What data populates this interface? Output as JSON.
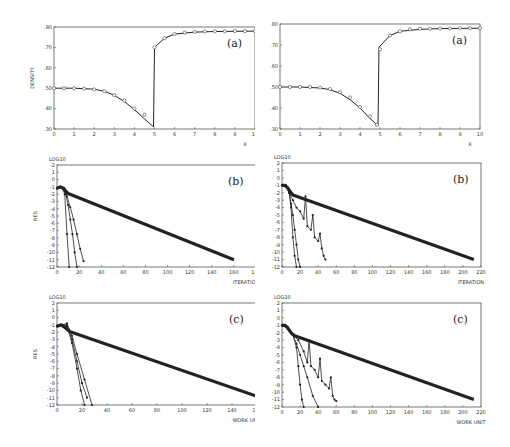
{
  "chart_data": [
    {
      "id": "top-left",
      "type": "line",
      "panel_label": "(a)",
      "ylabel": "DENSITY",
      "xlabel": "X",
      "xlim": [
        0,
        10
      ],
      "ylim": [
        0.3,
        0.8
      ],
      "x_ticks": [
        "0",
        "1",
        "2",
        "3",
        "4",
        "5",
        "6",
        "7",
        "8",
        "9",
        "10"
      ],
      "y_ticks": [
        ".30",
        ".40",
        ".50",
        ".60",
        ".70",
        ".80"
      ],
      "series": [
        {
          "name": "exact",
          "style": "solid",
          "x": [
            0,
            1,
            2,
            2.5,
            3,
            3.5,
            4,
            4.5,
            4.9,
            4.95,
            5.0,
            5.5,
            6,
            7,
            8,
            9,
            10
          ],
          "y": [
            0.5,
            0.5,
            0.495,
            0.485,
            0.465,
            0.435,
            0.395,
            0.35,
            0.315,
            0.31,
            0.7,
            0.745,
            0.765,
            0.775,
            0.778,
            0.779,
            0.78
          ]
        },
        {
          "name": "computed",
          "style": "markers-circle",
          "x": [
            0,
            0.5,
            1,
            1.5,
            2,
            2.5,
            3,
            3.5,
            4,
            4.5,
            5,
            5.5,
            6,
            6.5,
            7,
            7.5,
            8,
            8.5,
            9,
            9.5,
            10
          ],
          "y": [
            0.5,
            0.5,
            0.5,
            0.498,
            0.494,
            0.485,
            0.466,
            0.44,
            0.4,
            0.37,
            0.7,
            0.745,
            0.765,
            0.772,
            0.776,
            0.778,
            0.779,
            0.779,
            0.78,
            0.78,
            0.78
          ]
        }
      ]
    },
    {
      "id": "top-right",
      "type": "line",
      "panel_label": "(a)",
      "ylabel": "",
      "xlabel": "X",
      "xlim": [
        0,
        10
      ],
      "ylim": [
        0.3,
        0.8
      ],
      "x_ticks": [
        "0",
        "1",
        "2",
        "3",
        "4",
        "5",
        "6",
        "7",
        "8",
        "9",
        "10"
      ],
      "y_ticks": [
        ".30",
        ".40",
        ".50",
        ".60",
        ".70",
        ".80"
      ],
      "series": [
        {
          "name": "exact",
          "style": "solid",
          "x": [
            0,
            1,
            2,
            2.5,
            3,
            3.5,
            4,
            4.5,
            4.85,
            4.9,
            4.95,
            5.5,
            6,
            7,
            8,
            9,
            10
          ],
          "y": [
            0.5,
            0.5,
            0.495,
            0.487,
            0.47,
            0.44,
            0.4,
            0.35,
            0.32,
            0.315,
            0.69,
            0.745,
            0.765,
            0.775,
            0.778,
            0.779,
            0.78
          ]
        },
        {
          "name": "computed",
          "style": "markers-circle",
          "x": [
            0,
            0.5,
            1,
            1.5,
            2,
            2.5,
            3,
            3.5,
            4,
            4.5,
            4.85,
            5,
            5.5,
            6,
            6.5,
            7,
            7.5,
            8,
            8.5,
            9,
            9.5,
            10
          ],
          "y": [
            0.5,
            0.5,
            0.5,
            0.5,
            0.497,
            0.49,
            0.475,
            0.45,
            0.405,
            0.36,
            0.32,
            0.68,
            0.745,
            0.765,
            0.775,
            0.777,
            0.778,
            0.779,
            0.779,
            0.78,
            0.78,
            0.78
          ]
        }
      ]
    },
    {
      "id": "middle-left",
      "type": "line",
      "panel_label": "(b)",
      "ylabel": "RES",
      "ytitle_top": "LOG10",
      "xlabel": "ITERATION",
      "xlim": [
        0,
        180
      ],
      "ylim": [
        -12,
        2
      ],
      "x_ticks": [
        "0",
        "20",
        "40",
        "60",
        "80",
        "100",
        "120",
        "140",
        "160",
        "180"
      ],
      "y_ticks": [
        "2",
        "1",
        "0",
        "-1",
        "-2",
        "-3",
        "-4",
        "-5",
        "-6",
        "-7",
        "-8",
        "-9",
        "-10",
        "-11",
        "-12"
      ],
      "series": [
        {
          "name": "slow",
          "style": "thick",
          "x": [
            0,
            3,
            6,
            8,
            10,
            160
          ],
          "y": [
            -1.2,
            -1.0,
            -1.2,
            -1.6,
            -1.9,
            -11.0
          ]
        },
        {
          "name": "fast-1",
          "style": "markers",
          "x": [
            0,
            3,
            5,
            7,
            9,
            11
          ],
          "y": [
            -1.2,
            -1.0,
            -1.2,
            -2.0,
            -7.5,
            -12.0
          ]
        },
        {
          "name": "fast-2",
          "style": "markers",
          "x": [
            0,
            3,
            6,
            8,
            10,
            12,
            14,
            16,
            18
          ],
          "y": [
            -1.2,
            -1.0,
            -1.3,
            -2.0,
            -3.5,
            -5.5,
            -7.5,
            -10.0,
            -12.0
          ]
        },
        {
          "name": "fast-3",
          "style": "markers",
          "x": [
            0,
            3,
            6,
            9,
            12,
            15,
            18,
            21,
            24
          ],
          "y": [
            -1.2,
            -1.0,
            -1.4,
            -2.3,
            -3.8,
            -5.5,
            -7.5,
            -9.5,
            -11.2
          ]
        }
      ]
    },
    {
      "id": "middle-right",
      "type": "line",
      "panel_label": "(b)",
      "ylabel": "",
      "ytitle_top": "LOG10",
      "xlabel": "ITERATION",
      "xlim": [
        0,
        220
      ],
      "ylim": [
        -12,
        2
      ],
      "x_ticks": [
        "0",
        "20",
        "40",
        "60",
        "80",
        "100",
        "120",
        "140",
        "160",
        "180",
        "200",
        "220"
      ],
      "y_ticks": [
        "2",
        "1",
        "0",
        "-1",
        "-2",
        "-3",
        "-4",
        "-5",
        "-6",
        "-7",
        "-8",
        "-9",
        "-10",
        "-11",
        "-12"
      ],
      "series": [
        {
          "name": "slow",
          "style": "thick",
          "x": [
            0,
            3,
            6,
            10,
            12,
            212
          ],
          "y": [
            -1.0,
            -1.0,
            -1.3,
            -2.0,
            -2.3,
            -11.0
          ]
        },
        {
          "name": "fast-1",
          "style": "markers",
          "x": [
            0,
            4,
            8,
            10,
            12,
            14,
            16
          ],
          "y": [
            -1.0,
            -1.0,
            -2.0,
            -4.0,
            -8.0,
            -10.5,
            -12.0
          ]
        },
        {
          "name": "fast-2",
          "style": "markers",
          "x": [
            0,
            4,
            8,
            10,
            12,
            14,
            16,
            18,
            20
          ],
          "y": [
            -1.0,
            -1.0,
            -2.0,
            -3.5,
            -5.0,
            -7.0,
            -9.0,
            -11.0,
            -12.0
          ]
        },
        {
          "name": "oscillating",
          "style": "markers",
          "x": [
            0,
            4,
            8,
            12,
            16,
            20,
            24,
            26,
            28,
            32,
            34,
            36,
            40,
            42,
            44,
            46,
            48
          ],
          "y": [
            -1.0,
            -1.0,
            -2.0,
            -3.0,
            -4.0,
            -4.5,
            -5.5,
            -2.5,
            -6.5,
            -7.0,
            -5.0,
            -8.0,
            -8.5,
            -7.5,
            -9.5,
            -10.5,
            -11.0
          ]
        }
      ]
    },
    {
      "id": "bottom-left",
      "type": "line",
      "panel_label": "(c)",
      "ylabel": "RES",
      "ytitle_top": "LOG10",
      "xlabel": "WORK UNIT",
      "xlim": [
        0,
        160
      ],
      "ylim": [
        -12,
        2
      ],
      "x_ticks": [
        "0",
        "20",
        "40",
        "60",
        "80",
        "100",
        "120",
        "140",
        "160"
      ],
      "y_ticks": [
        "2",
        "1",
        "0",
        "-1",
        "-2",
        "-3",
        "-4",
        "-5",
        "-6",
        "-7",
        "-8",
        "-9",
        "-10",
        "-11",
        "-12"
      ],
      "series": [
        {
          "name": "slow",
          "style": "thick",
          "x": [
            0,
            3,
            6,
            8,
            10,
            160
          ],
          "y": [
            -1.2,
            -1.0,
            -1.3,
            -1.6,
            -1.9,
            -10.8
          ]
        },
        {
          "name": "fast-1",
          "style": "markers",
          "x": [
            0,
            4,
            8,
            12,
            16,
            19,
            22
          ],
          "y": [
            -1.2,
            -1.0,
            -1.2,
            -3.5,
            -7.0,
            -10.0,
            -12.0
          ]
        },
        {
          "name": "fast-2",
          "style": "markers",
          "x": [
            0,
            4,
            8,
            12,
            16,
            20,
            24
          ],
          "y": [
            -1.2,
            -1.0,
            -1.0,
            -3.0,
            -6.0,
            -9.0,
            -11.0
          ]
        },
        {
          "name": "fast-3",
          "style": "markers",
          "x": [
            0,
            4,
            8,
            12,
            16,
            22,
            28
          ],
          "y": [
            -1.2,
            -1.0,
            -0.8,
            -2.5,
            -5.0,
            -8.5,
            -12.0
          ]
        }
      ]
    },
    {
      "id": "bottom-right",
      "type": "line",
      "panel_label": "(c)",
      "ylabel": "",
      "ytitle_top": "LOG10",
      "xlabel": "WORK UNIT",
      "xlim": [
        0,
        220
      ],
      "ylim": [
        -12,
        2
      ],
      "x_ticks": [
        "0",
        "20",
        "40",
        "60",
        "80",
        "100",
        "120",
        "140",
        "160",
        "180",
        "200",
        "220"
      ],
      "y_ticks": [
        "2",
        "1",
        "0",
        "-1",
        "-2",
        "-3",
        "-4",
        "-5",
        "-6",
        "-7",
        "-8",
        "-9",
        "-10",
        "-11",
        "-12"
      ],
      "series": [
        {
          "name": "slow",
          "style": "thick",
          "x": [
            0,
            3,
            6,
            10,
            14,
            212
          ],
          "y": [
            -1.0,
            -1.0,
            -1.3,
            -2.0,
            -2.4,
            -11.0
          ]
        },
        {
          "name": "fast-1",
          "style": "markers",
          "x": [
            0,
            6,
            12,
            16,
            18,
            20,
            22,
            24
          ],
          "y": [
            -1.0,
            -1.3,
            -2.3,
            -4.0,
            -6.5,
            -9.0,
            -11.0,
            -12.0
          ]
        },
        {
          "name": "fast-2",
          "style": "markers",
          "x": [
            0,
            6,
            12,
            16,
            20,
            24,
            28,
            34,
            40
          ],
          "y": [
            -1.0,
            -1.3,
            -2.3,
            -3.5,
            -5.0,
            -6.5,
            -8.0,
            -10.5,
            -12.0
          ]
        },
        {
          "name": "oscillating",
          "style": "markers",
          "x": [
            0,
            6,
            12,
            18,
            24,
            28,
            30,
            32,
            36,
            40,
            42,
            44,
            48,
            52,
            54,
            56,
            58,
            60
          ],
          "y": [
            -1.0,
            -1.3,
            -2.3,
            -3.0,
            -4.5,
            -6.0,
            -3.0,
            -6.5,
            -7.0,
            -8.0,
            -5.5,
            -8.5,
            -9.0,
            -9.5,
            -8.0,
            -10.5,
            -11.0,
            -11.2
          ]
        }
      ]
    }
  ]
}
